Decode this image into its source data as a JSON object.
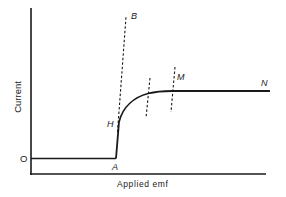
{
  "diagram": {
    "type": "current-voltage characteristic",
    "y_axis_label": "Current",
    "x_axis_label": "Applied emf",
    "origin_label": "O",
    "point_labels": {
      "A": "A",
      "B": "B",
      "H": "H",
      "M": "M",
      "N": "N"
    },
    "colors": {
      "ink": "#1a1a1a",
      "background": "#ffffff"
    },
    "curve_description": "Flat baseline from O to A, steep rise A to H, curved knee bending to a flat plateau from M to N; dashed construction lines through H toward B and two dashed verticals at the knee and at M."
  }
}
